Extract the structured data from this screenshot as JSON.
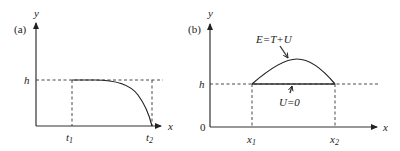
{
  "panels": [
    {
      "id": "a",
      "label": "(a)",
      "y_axis_label": "y",
      "x_axis_label": "x",
      "h_label": "h",
      "t1_label": "t",
      "t1_sub": "1",
      "t2_label": "t",
      "t2_sub": "2"
    },
    {
      "id": "b",
      "label": "(b)",
      "y_axis_label": "y",
      "x_axis_label": "x",
      "origin_label": "0",
      "h_label": "h",
      "x1_label": "x",
      "x1_sub": "1",
      "x2_label": "x",
      "x2_sub": "2",
      "energy_annotation": "E=T+U",
      "potential_annotation": "U=0"
    }
  ]
}
